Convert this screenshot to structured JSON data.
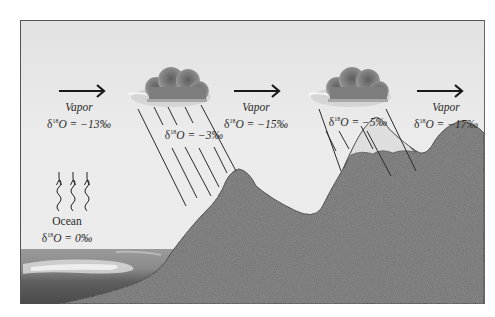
{
  "diagram": {
    "title": "",
    "colors": {
      "sky": "#e8e8e8",
      "mountain": "#6e6e6e",
      "snow": "#d9d9d9",
      "ocean_dark": "#5a5a5a",
      "ocean_light": "#cfcfcf",
      "cloud": "#7a7a7a",
      "ink": "#222222"
    },
    "ocean": {
      "label": "Ocean",
      "delta_symbol": "δ",
      "isotope_mass": "18",
      "element": "O",
      "value": "= 0‰"
    },
    "vapor_stages": [
      {
        "label": "Vapor",
        "delta_symbol": "δ",
        "isotope_mass": "18",
        "element": "O",
        "value": "= −13‰"
      },
      {
        "label": "Vapor",
        "delta_symbol": "δ",
        "isotope_mass": "18",
        "element": "O",
        "value": "= −15‰"
      },
      {
        "label": "Vapor",
        "delta_symbol": "δ",
        "isotope_mass": "18",
        "element": "O",
        "value": "= −17‰"
      }
    ],
    "precipitation": [
      {
        "delta_symbol": "δ",
        "isotope_mass": "18",
        "element": "O",
        "value": "= −3‰"
      },
      {
        "delta_symbol": "δ",
        "isotope_mass": "18",
        "element": "O",
        "value": "= −5‰"
      }
    ],
    "icons": {
      "arrow": "right-arrow-icon",
      "cloud": "rain-cloud-icon",
      "evaporation": "wavy-up-arrow-icon"
    }
  }
}
